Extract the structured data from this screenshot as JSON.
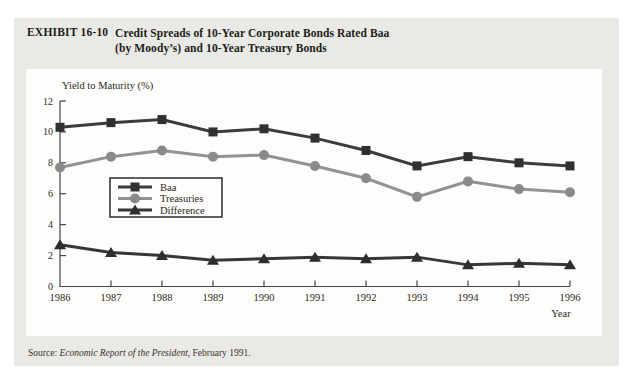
{
  "exhibit": {
    "label": "EXHIBIT 16-10",
    "title_line1": "Credit Spreads of 10-Year Corporate Bonds Rated Baa",
    "title_line2": "(by Moody’s) and 10-Year Treasury Bonds"
  },
  "source": {
    "prefix": "Source: ",
    "work": "Economic Report of the President",
    "suffix": ", February 1991."
  },
  "chart_data": {
    "type": "line",
    "ylabel": "Yield to Maturity (%)",
    "xlabel": "Year",
    "ylim": [
      0,
      12
    ],
    "yticks": [
      0,
      2,
      4,
      6,
      8,
      10,
      12
    ],
    "categories": [
      "1986",
      "1987",
      "1988",
      "1989",
      "1990",
      "1991",
      "1992",
      "1993",
      "1994",
      "1995",
      "1996"
    ],
    "series": [
      {
        "name": "Baa",
        "marker": "square",
        "color": "#3c3c3c",
        "marker_color": "#303030",
        "values": [
          10.3,
          10.6,
          10.8,
          10.0,
          10.2,
          9.6,
          8.8,
          7.8,
          8.4,
          8.0,
          7.8
        ]
      },
      {
        "name": "Treasuries",
        "marker": "circle",
        "color": "#929292",
        "marker_color": "#8a8a8a",
        "values": [
          7.7,
          8.4,
          8.8,
          8.4,
          8.5,
          7.8,
          7.0,
          5.8,
          6.8,
          6.3,
          6.1
        ]
      },
      {
        "name": "Difference",
        "marker": "triangle",
        "color": "#373737",
        "marker_color": "#2e2e2e",
        "values": [
          2.7,
          2.2,
          2.0,
          1.7,
          1.8,
          1.9,
          1.8,
          1.9,
          1.4,
          1.5,
          1.4
        ]
      }
    ],
    "legend_position": "upper-left-inside",
    "grid": false
  },
  "colors": {
    "page_bg": "#ffffff",
    "exhibit_bg": "#e9e9e6",
    "panel_bg": "#fdfdfb",
    "axis": "#454545",
    "text": "#2e2822"
  }
}
